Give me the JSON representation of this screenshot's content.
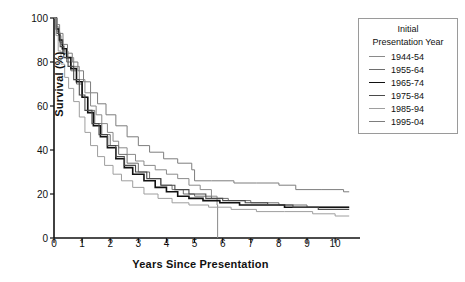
{
  "chart_data": {
    "type": "line",
    "title": "",
    "xlabel": "Years Since Presentation",
    "ylabel": "Survival (%)",
    "xlim": [
      0,
      10.6
    ],
    "ylim": [
      0,
      100
    ],
    "xticks": [
      0,
      1,
      2,
      3,
      4,
      5,
      6,
      7,
      8,
      9,
      10
    ],
    "yticks": [
      0,
      20,
      40,
      60,
      80,
      100
    ],
    "grid": false,
    "legend_position": "right-top",
    "legend_title": "Initial Presentation Year",
    "legend_title_line1": "Initial",
    "legend_title_line2": "Presentation Year",
    "series": [
      {
        "name": "1944-54",
        "color": "#8a8a8a",
        "width": 1.0,
        "points": [
          [
            0,
            100
          ],
          [
            0.08,
            96
          ],
          [
            0.17,
            92
          ],
          [
            0.25,
            88
          ],
          [
            0.35,
            85
          ],
          [
            0.5,
            82
          ],
          [
            0.7,
            78
          ],
          [
            0.9,
            72
          ],
          [
            1.1,
            66
          ],
          [
            1.3,
            60
          ],
          [
            1.5,
            56
          ],
          [
            1.7,
            52
          ],
          [
            1.9,
            48
          ],
          [
            2.1,
            44
          ],
          [
            2.3,
            41
          ],
          [
            2.6,
            38
          ],
          [
            2.9,
            35
          ],
          [
            3.2,
            33
          ],
          [
            3.6,
            31
          ],
          [
            4.0,
            29
          ],
          [
            4.4,
            27
          ],
          [
            4.8,
            24
          ],
          [
            5.2,
            22
          ],
          [
            5.6,
            19
          ],
          [
            5.8,
            15
          ],
          [
            5.82,
            0
          ]
        ]
      },
      {
        "name": "1955-64",
        "color": "#6e6e6e",
        "width": 1.0,
        "points": [
          [
            0,
            100
          ],
          [
            0.1,
            94
          ],
          [
            0.2,
            89
          ],
          [
            0.3,
            84
          ],
          [
            0.45,
            80
          ],
          [
            0.6,
            76
          ],
          [
            0.8,
            70
          ],
          [
            1.0,
            64
          ],
          [
            1.2,
            58
          ],
          [
            1.45,
            52
          ],
          [
            1.7,
            47
          ],
          [
            2.0,
            42
          ],
          [
            2.3,
            38
          ],
          [
            2.6,
            34
          ],
          [
            3.0,
            30
          ],
          [
            3.4,
            27
          ],
          [
            3.8,
            24
          ],
          [
            4.2,
            22
          ],
          [
            4.6,
            20
          ],
          [
            5.0,
            19
          ],
          [
            5.6,
            18
          ],
          [
            6.2,
            17
          ],
          [
            7.0,
            16
          ],
          [
            8.0,
            15
          ],
          [
            9.0,
            14
          ],
          [
            10.0,
            14
          ],
          [
            10.5,
            14
          ]
        ]
      },
      {
        "name": "1965-74",
        "color": "#111111",
        "width": 1.6,
        "points": [
          [
            0,
            100
          ],
          [
            0.08,
            95
          ],
          [
            0.18,
            90
          ],
          [
            0.3,
            86
          ],
          [
            0.45,
            82
          ],
          [
            0.6,
            77
          ],
          [
            0.8,
            71
          ],
          [
            1.0,
            64
          ],
          [
            1.2,
            57
          ],
          [
            1.4,
            51
          ],
          [
            1.65,
            46
          ],
          [
            1.9,
            41
          ],
          [
            2.2,
            36
          ],
          [
            2.5,
            32
          ],
          [
            2.8,
            29
          ],
          [
            3.2,
            26
          ],
          [
            3.6,
            23
          ],
          [
            4.0,
            21
          ],
          [
            4.4,
            19
          ],
          [
            4.8,
            18
          ],
          [
            5.3,
            17
          ],
          [
            5.9,
            16
          ],
          [
            6.6,
            15
          ],
          [
            7.4,
            15
          ],
          [
            8.2,
            14
          ],
          [
            9.2,
            14
          ],
          [
            10.2,
            14
          ],
          [
            10.5,
            14
          ]
        ]
      },
      {
        "name": "1975-84",
        "color": "#4a4a4a",
        "width": 1.1,
        "points": [
          [
            0,
            100
          ],
          [
            0.1,
            93
          ],
          [
            0.22,
            87
          ],
          [
            0.35,
            82
          ],
          [
            0.5,
            78
          ],
          [
            0.7,
            72
          ],
          [
            0.9,
            65
          ],
          [
            1.1,
            58
          ],
          [
            1.35,
            52
          ],
          [
            1.6,
            47
          ],
          [
            1.9,
            42
          ],
          [
            2.2,
            37
          ],
          [
            2.5,
            33
          ],
          [
            2.9,
            30
          ],
          [
            3.3,
            27
          ],
          [
            3.8,
            24
          ],
          [
            4.3,
            22
          ],
          [
            4.8,
            20
          ],
          [
            5.4,
            18
          ],
          [
            6.0,
            17
          ],
          [
            6.8,
            16
          ],
          [
            7.6,
            15
          ],
          [
            8.5,
            14
          ],
          [
            9.4,
            13
          ],
          [
            10.2,
            13
          ],
          [
            10.5,
            13
          ]
        ]
      },
      {
        "name": "1985-94",
        "color": "#9e9e9e",
        "width": 1.0,
        "points": [
          [
            0,
            100
          ],
          [
            0.07,
            92
          ],
          [
            0.15,
            85
          ],
          [
            0.25,
            79
          ],
          [
            0.38,
            73
          ],
          [
            0.52,
            68
          ],
          [
            0.7,
            62
          ],
          [
            0.9,
            55
          ],
          [
            1.1,
            48
          ],
          [
            1.3,
            42
          ],
          [
            1.55,
            37
          ],
          [
            1.8,
            33
          ],
          [
            2.1,
            29
          ],
          [
            2.4,
            26
          ],
          [
            2.8,
            23
          ],
          [
            3.2,
            20
          ],
          [
            3.7,
            18
          ],
          [
            4.2,
            16
          ],
          [
            4.8,
            15
          ],
          [
            5.5,
            14
          ],
          [
            6.3,
            13
          ],
          [
            7.2,
            12
          ],
          [
            8.2,
            12
          ],
          [
            9.2,
            11
          ],
          [
            10.0,
            10
          ],
          [
            10.5,
            10
          ]
        ]
      },
      {
        "name": "1995-04",
        "color": "#7d7d7d",
        "width": 1.0,
        "points": [
          [
            0,
            100
          ],
          [
            0.1,
            97
          ],
          [
            0.2,
            93
          ],
          [
            0.32,
            88
          ],
          [
            0.48,
            84
          ],
          [
            0.65,
            80
          ],
          [
            0.85,
            76
          ],
          [
            1.05,
            71
          ],
          [
            1.3,
            66
          ],
          [
            1.55,
            61
          ],
          [
            1.85,
            56
          ],
          [
            2.2,
            51
          ],
          [
            2.6,
            46
          ],
          [
            3.0,
            42
          ],
          [
            3.4,
            39
          ],
          [
            3.9,
            36
          ],
          [
            4.4,
            34
          ],
          [
            4.9,
            31
          ],
          [
            5.0,
            26
          ],
          [
            5.6,
            26
          ],
          [
            6.4,
            25
          ],
          [
            7.2,
            25
          ],
          [
            8.0,
            24
          ],
          [
            8.6,
            22
          ],
          [
            9.5,
            22
          ],
          [
            10.3,
            21
          ],
          [
            10.5,
            21
          ]
        ]
      }
    ]
  }
}
